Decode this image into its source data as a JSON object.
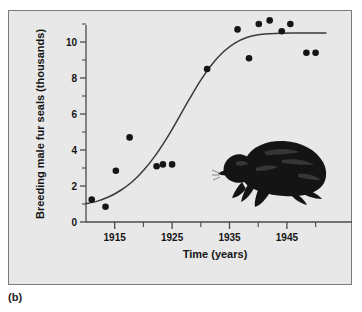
{
  "figure": {
    "panel_label": "(b)",
    "background_color": "#e8e8e8",
    "frame_color": "#7b7b7b",
    "ink_color": "#151515"
  },
  "illustration": {
    "name": "fur-seal-illustration",
    "color": "#141414",
    "description": "silhouette of a breeding male fur seal"
  },
  "chart_data": {
    "type": "scatter",
    "title": "",
    "subtitle": "",
    "xlabel": "Time (years)",
    "ylabel": "Breeding male fur seals (thousands)",
    "xlim": [
      1910,
      1952
    ],
    "ylim": [
      0,
      11.6
    ],
    "grid": false,
    "legend": null,
    "x_ticks_major": [
      1915,
      1925,
      1935,
      1945
    ],
    "x_ticks_major_labels": [
      "1915",
      "1925",
      "1935",
      "1945"
    ],
    "x_ticks_minor": [
      1920,
      1930,
      1940,
      1950
    ],
    "y_ticks_major": [
      0,
      2,
      4,
      6,
      8,
      10
    ],
    "y_ticks_major_labels": [
      "0",
      "2",
      "4",
      "6",
      "8",
      "10"
    ],
    "y_ticks_minor": [
      1,
      3,
      5,
      7,
      9,
      11
    ],
    "series": [
      {
        "name": "Observed breeding male fur seals",
        "type": "scatter",
        "marker": "filled-circle",
        "color": "#151515",
        "points": [
          {
            "x": 1911.0,
            "y": 1.25
          },
          {
            "x": 1913.4,
            "y": 0.85
          },
          {
            "x": 1915.2,
            "y": 2.85
          },
          {
            "x": 1917.6,
            "y": 4.7
          },
          {
            "x": 1922.3,
            "y": 3.1
          },
          {
            "x": 1923.4,
            "y": 3.2
          },
          {
            "x": 1925.0,
            "y": 3.2
          },
          {
            "x": 1931.1,
            "y": 8.5
          },
          {
            "x": 1936.4,
            "y": 10.7
          },
          {
            "x": 1938.4,
            "y": 9.1
          },
          {
            "x": 1940.1,
            "y": 11.0
          },
          {
            "x": 1942.0,
            "y": 11.2
          },
          {
            "x": 1944.1,
            "y": 10.6
          },
          {
            "x": 1945.6,
            "y": 11.0
          },
          {
            "x": 1948.4,
            "y": 9.4
          },
          {
            "x": 1950.0,
            "y": 9.4
          }
        ]
      },
      {
        "name": "Fitted logistic growth curve",
        "type": "line",
        "color": "#3a3a3a",
        "points": [
          {
            "x": 1910.0,
            "y": 1.02
          },
          {
            "x": 1912.0,
            "y": 1.16
          },
          {
            "x": 1914.0,
            "y": 1.4
          },
          {
            "x": 1916.0,
            "y": 1.75
          },
          {
            "x": 1918.0,
            "y": 2.22
          },
          {
            "x": 1920.0,
            "y": 2.86
          },
          {
            "x": 1922.0,
            "y": 3.66
          },
          {
            "x": 1924.0,
            "y": 4.62
          },
          {
            "x": 1926.0,
            "y": 5.7
          },
          {
            "x": 1928.0,
            "y": 6.82
          },
          {
            "x": 1930.0,
            "y": 7.88
          },
          {
            "x": 1932.0,
            "y": 8.78
          },
          {
            "x": 1934.0,
            "y": 9.47
          },
          {
            "x": 1936.0,
            "y": 9.95
          },
          {
            "x": 1938.0,
            "y": 10.25
          },
          {
            "x": 1940.0,
            "y": 10.4
          },
          {
            "x": 1942.0,
            "y": 10.46
          },
          {
            "x": 1944.0,
            "y": 10.49
          },
          {
            "x": 1946.0,
            "y": 10.5
          },
          {
            "x": 1948.0,
            "y": 10.5
          },
          {
            "x": 1951.8,
            "y": 10.5
          }
        ]
      }
    ]
  }
}
